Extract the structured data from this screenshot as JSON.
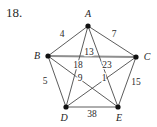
{
  "figure": {
    "problem_number": "18.",
    "canvas": {
      "width": 157,
      "height": 127
    },
    "colors": {
      "background": "#ffffff",
      "edge": "#4a4a4a",
      "edge_highlight": "#8e8e8e",
      "vertex": "#111111",
      "text": "#2b2b2b"
    }
  },
  "chart_data": {
    "type": "diagram",
    "graph_type": "complete-weighted-graph",
    "title": "18.",
    "nodes": [
      {
        "id": "A",
        "label": "A",
        "x": 88,
        "y": 26,
        "label_x": 88,
        "label_y": 17
      },
      {
        "id": "B",
        "label": "B",
        "x": 48,
        "y": 56,
        "label_x": 37,
        "label_y": 59
      },
      {
        "id": "C",
        "label": "C",
        "x": 136,
        "y": 57,
        "label_x": 147,
        "label_y": 60
      },
      {
        "id": "D",
        "label": "D",
        "x": 66,
        "y": 107,
        "label_x": 64,
        "label_y": 121
      },
      {
        "id": "E",
        "label": "E",
        "x": 118,
        "y": 107,
        "label_x": 119,
        "label_y": 121
      }
    ],
    "edges": [
      {
        "id": "AB",
        "from": "A",
        "to": "B",
        "weight": "4",
        "label_x": 62,
        "label_y": 37,
        "highlight": false
      },
      {
        "id": "AC",
        "from": "A",
        "to": "C",
        "weight": "7",
        "label_x": 114,
        "label_y": 37,
        "highlight": false
      },
      {
        "id": "BC",
        "from": "B",
        "to": "C",
        "weight": "13",
        "label_x": 89,
        "label_y": 55,
        "highlight": true
      },
      {
        "id": "AD",
        "from": "A",
        "to": "D",
        "weight": "18",
        "label_x": 78,
        "label_y": 68,
        "highlight": false
      },
      {
        "id": "AE",
        "from": "A",
        "to": "E",
        "weight": "23",
        "label_x": 107,
        "label_y": 68,
        "highlight": false
      },
      {
        "id": "BD",
        "from": "B",
        "to": "D",
        "weight": "5",
        "label_x": 45,
        "label_y": 84,
        "highlight": false
      },
      {
        "id": "BE",
        "from": "B",
        "to": "E",
        "weight": "9",
        "label_x": 80,
        "label_y": 81,
        "highlight": false
      },
      {
        "id": "CD",
        "from": "C",
        "to": "D",
        "weight": "1",
        "label_x": 104,
        "label_y": 81,
        "highlight": false
      },
      {
        "id": "CE",
        "from": "C",
        "to": "E",
        "weight": "15",
        "label_x": 136,
        "label_y": 85,
        "highlight": false
      },
      {
        "id": "DE",
        "from": "D",
        "to": "E",
        "weight": "38",
        "label_x": 92,
        "label_y": 117,
        "highlight": false
      }
    ],
    "node_labels": [
      "A",
      "B",
      "C",
      "D",
      "E"
    ],
    "weights": [
      "4",
      "7",
      "13",
      "18",
      "23",
      "5",
      "9",
      "1",
      "15",
      "38"
    ]
  }
}
